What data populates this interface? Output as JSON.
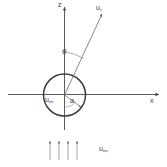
{
  "figure": {
    "type": "scattering-geometry-diagram",
    "background_color": "#ffffff",
    "stroke_color": "#4a4a4a",
    "text_color": "#3a3a3a"
  },
  "axes": {
    "vertical": {
      "label": "z",
      "direction": "up",
      "arrow": true
    },
    "horizontal": {
      "label": "x",
      "direction": "right",
      "arrow": true
    },
    "origin_label": ""
  },
  "scatterer": {
    "shape": "circle",
    "radius_label": "a",
    "interior_field_label": "u",
    "interior_field_sub": "int"
  },
  "scattered": {
    "label": "u",
    "sub": "s",
    "angle_label": "θ",
    "angle_from": "z-axis"
  },
  "incident": {
    "label": "u",
    "sub": "inc",
    "arrow_count": 4,
    "direction": "upward"
  }
}
